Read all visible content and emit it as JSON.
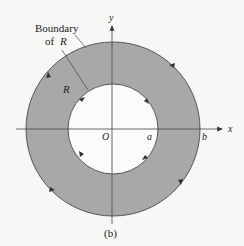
{
  "figure": {
    "caption": "(b)",
    "labels": {
      "boundary_line1": "Boundary",
      "boundary_line2": "of",
      "boundary_var": "R",
      "region": "R",
      "origin": "O",
      "inner_radius": "a",
      "outer_radius": "b",
      "x_axis": "x",
      "y_axis": "y"
    },
    "colors": {
      "region_fill": "#a8a8a8",
      "stroke": "#555555",
      "background": "#f7f7f5"
    },
    "geometry": {
      "center": [
        113,
        129
      ],
      "outer_radius": 87,
      "inner_radius": 45
    },
    "orientation": {
      "outer": "counterclockwise",
      "inner": "clockwise"
    }
  }
}
